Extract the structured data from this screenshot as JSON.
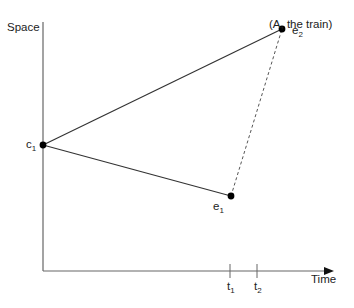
{
  "diagram": {
    "title": "(A, the train)",
    "axes": {
      "y_label": "Space",
      "x_label": "Time"
    },
    "points": {
      "c1": {
        "name": "c",
        "sub": "1"
      },
      "e1": {
        "name": "e",
        "sub": "1"
      },
      "e2": {
        "name": "e",
        "sub": "2"
      }
    },
    "ticks": {
      "t1": {
        "name": "t",
        "sub": "1"
      },
      "t2": {
        "name": "t",
        "sub": "2"
      }
    },
    "edges": [
      {
        "from": "c1",
        "to": "e2",
        "style": "solid"
      },
      {
        "from": "c1",
        "to": "e1",
        "style": "solid"
      },
      {
        "from": "e1",
        "to": "e2",
        "style": "dashed"
      }
    ],
    "colors": {
      "axis": "#666666",
      "line": "#333333",
      "point": "#000000"
    }
  }
}
